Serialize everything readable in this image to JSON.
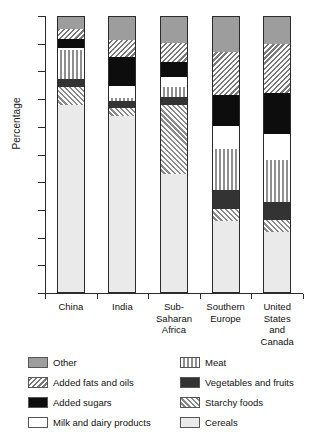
{
  "chart_data": {
    "type": "bar",
    "subtype": "stacked-bar-100",
    "title": "",
    "xlabel": "",
    "ylabel": "Percentage",
    "ylim": [
      0,
      100
    ],
    "ytick_values": [
      0,
      10,
      20,
      30,
      40,
      50,
      60,
      70,
      80,
      90,
      100
    ],
    "ytick_labels": [
      "0",
      "10",
      "20",
      "30",
      "40",
      "50",
      "60",
      "70",
      "80",
      "90",
      "100"
    ],
    "grid": false,
    "legend_position": "below-plot-two-columns",
    "categories": [
      "China",
      "India",
      "Sub-Saharan Africa",
      "Southern Europe",
      "United States and Canada"
    ],
    "category_label_lines": [
      [
        "China"
      ],
      [
        "India"
      ],
      [
        "Sub-",
        "Saharan",
        "Africa"
      ],
      [
        "Southern",
        "Europe"
      ],
      [
        "United",
        "States",
        "and",
        "Canada"
      ]
    ],
    "stack_order_bottom_to_top": [
      "Cereals",
      "Starchy foods",
      "Vegetables and fruits",
      "Meat",
      "Milk and dairy products",
      "Added sugars",
      "Added fats and oils",
      "Other"
    ],
    "series": [
      {
        "name": "Cereals",
        "pattern": "light-solid",
        "color": "#eaeaea",
        "values": [
          67.5,
          63.5,
          42.5,
          25.5,
          21.5
        ]
      },
      {
        "name": "Starchy foods",
        "pattern": "diagonal-hatch-up",
        "color": "#8a8a8a",
        "values": [
          6.5,
          3.0,
          25.0,
          4.5,
          4.5
        ]
      },
      {
        "name": "Vegetables and fruits",
        "pattern": "dark-solid",
        "color": "#333333",
        "values": [
          3.0,
          2.5,
          3.0,
          7.0,
          6.5
        ]
      },
      {
        "name": "Meat",
        "pattern": "vertical-hatch",
        "color": "#8f8f8f",
        "values": [
          10.5,
          1.0,
          3.5,
          14.5,
          15.0
        ]
      },
      {
        "name": "Milk and dairy products",
        "pattern": "white-solid",
        "color": "#ffffff",
        "values": [
          0.5,
          4.5,
          3.5,
          8.5,
          9.5
        ]
      },
      {
        "name": "Added sugars",
        "pattern": "black-solid",
        "color": "#0d0d0d",
        "values": [
          3.5,
          10.5,
          5.5,
          11.0,
          15.0
        ]
      },
      {
        "name": "Added fats and oils",
        "pattern": "diagonal-hatch-down",
        "color": "#7a7a7a",
        "values": [
          3.5,
          6.0,
          7.0,
          15.5,
          17.5
        ]
      },
      {
        "name": "Other",
        "pattern": "grey-solid",
        "color": "#9d9d9d",
        "values": [
          5.0,
          9.0,
          10.0,
          13.5,
          10.5
        ]
      }
    ],
    "cumulative_tops": {
      "China": [
        67.5,
        74.0,
        77.0,
        87.5,
        88.0,
        91.5,
        95.0,
        100.0
      ],
      "India": [
        63.5,
        66.5,
        69.0,
        70.0,
        74.5,
        85.0,
        91.0,
        100.0
      ],
      "Sub-Saharan Africa": [
        42.5,
        67.5,
        70.5,
        74.0,
        77.5,
        83.0,
        90.0,
        100.0
      ],
      "Southern Europe": [
        25.5,
        30.0,
        37.0,
        51.5,
        60.0,
        71.0,
        86.5,
        100.0
      ],
      "United States and Canada": [
        21.5,
        26.0,
        32.5,
        47.5,
        57.0,
        72.0,
        89.5,
        100.0
      ]
    }
  },
  "legend": {
    "left_column": [
      {
        "label": "Other",
        "key": "other"
      },
      {
        "label": "Added fats and oils",
        "key": "fats"
      },
      {
        "label": "Added sugars",
        "key": "sugars"
      },
      {
        "label": "Milk and dairy products",
        "key": "milk"
      }
    ],
    "right_column": [
      {
        "label": "Meat",
        "key": "meat"
      },
      {
        "label": "Vegetables and fruits",
        "key": "veg"
      },
      {
        "label": "Starchy foods",
        "key": "starchy"
      },
      {
        "label": "Cereals",
        "key": "cereals"
      }
    ]
  }
}
